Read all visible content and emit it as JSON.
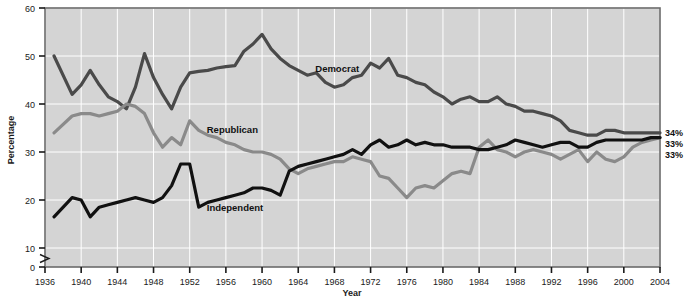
{
  "chart_data": {
    "type": "line",
    "title": "",
    "xlabel": "Year",
    "ylabel": "Percentage",
    "xlim": [
      1936,
      2004
    ],
    "ylim": [
      0,
      60
    ],
    "y_axis_break": true,
    "y_break_between": [
      0,
      10
    ],
    "grid": true,
    "grid_color": "#ffffff",
    "plot_background": "#d4d4d4",
    "legend_position": "inline-labels",
    "xticks": [
      1936,
      1940,
      1944,
      1948,
      1952,
      1956,
      1960,
      1964,
      1968,
      1972,
      1976,
      1980,
      1984,
      1988,
      1992,
      1996,
      2000,
      2004
    ],
    "ytick_labels": [
      "0",
      "10",
      "20",
      "30",
      "40",
      "50",
      "60"
    ],
    "yticks": [
      0,
      10,
      20,
      30,
      40,
      50,
      60
    ],
    "x": [
      1937,
      1939,
      1940,
      1941,
      1942,
      1943,
      1944,
      1945,
      1946,
      1947,
      1948,
      1949,
      1950,
      1951,
      1952,
      1953,
      1954,
      1955,
      1956,
      1957,
      1958,
      1959,
      1960,
      1961,
      1962,
      1963,
      1964,
      1965,
      1966,
      1967,
      1968,
      1969,
      1970,
      1971,
      1972,
      1973,
      1974,
      1975,
      1976,
      1977,
      1978,
      1979,
      1980,
      1981,
      1982,
      1983,
      1984,
      1985,
      1986,
      1987,
      1988,
      1989,
      1990,
      1991,
      1992,
      1993,
      1994,
      1995,
      1996,
      1997,
      1998,
      1999,
      2000,
      2001,
      2002,
      2003,
      2004
    ],
    "series": [
      {
        "name": "Democrat",
        "color": "#4a4a4a",
        "label_anchor_year": 1965,
        "end_value_label": "34%",
        "values": [
          50.0,
          42.0,
          44.0,
          47.0,
          44.0,
          41.5,
          40.5,
          39.0,
          43.5,
          50.5,
          45.5,
          42.0,
          39.0,
          43.5,
          46.5,
          46.8,
          47.0,
          47.5,
          47.8,
          48.0,
          51.0,
          52.5,
          54.5,
          51.5,
          49.5,
          48.0,
          47.0,
          46.0,
          46.5,
          44.5,
          43.5,
          44.0,
          45.5,
          46.0,
          48.5,
          47.5,
          49.5,
          46.0,
          45.5,
          44.5,
          44.0,
          42.5,
          41.5,
          40.0,
          41.0,
          41.5,
          40.5,
          40.5,
          41.5,
          40.0,
          39.5,
          38.5,
          38.5,
          38.0,
          37.5,
          36.5,
          34.5,
          34.0,
          33.5,
          33.5,
          34.5,
          34.5,
          34.0,
          34.0,
          34.0,
          34.0,
          34.0
        ]
      },
      {
        "name": "Republican",
        "color": "#8a8a8a",
        "label_anchor_year": 1953,
        "end_value_label": "33%",
        "values": [
          34.0,
          37.5,
          38.0,
          38.0,
          37.5,
          38.0,
          38.5,
          40.0,
          39.5,
          38.0,
          34.0,
          31.0,
          33.0,
          31.5,
          36.5,
          34.5,
          33.5,
          33.0,
          32.0,
          31.5,
          30.5,
          30.0,
          30.0,
          29.5,
          28.5,
          26.5,
          25.5,
          26.5,
          27.0,
          27.5,
          28.0,
          28.0,
          29.0,
          28.5,
          28.0,
          25.0,
          24.5,
          22.5,
          20.5,
          22.5,
          23.0,
          22.5,
          24.0,
          25.5,
          26.0,
          25.5,
          31.0,
          32.5,
          30.5,
          30.0,
          29.0,
          30.0,
          30.5,
          30.0,
          29.5,
          28.5,
          29.5,
          30.5,
          28.0,
          30.0,
          28.5,
          28.0,
          29.0,
          31.0,
          32.0,
          32.5,
          33.0
        ]
      },
      {
        "name": "Independent",
        "color": "#111111",
        "label_anchor_year": 1953,
        "end_value_label": "33%",
        "values": [
          16.5,
          20.5,
          20.0,
          16.5,
          18.5,
          19.0,
          19.5,
          20.0,
          20.5,
          20.0,
          19.5,
          20.5,
          23.0,
          27.5,
          27.5,
          18.5,
          19.5,
          20.0,
          20.5,
          21.0,
          21.5,
          22.5,
          22.5,
          22.0,
          21.0,
          26.0,
          27.0,
          27.5,
          28.0,
          28.5,
          29.0,
          29.5,
          30.5,
          29.5,
          31.5,
          32.5,
          31.0,
          31.5,
          32.5,
          31.5,
          32.0,
          31.5,
          31.5,
          31.0,
          31.0,
          31.0,
          30.5,
          30.5,
          31.0,
          31.5,
          32.5,
          32.0,
          31.5,
          31.0,
          31.5,
          32.0,
          32.0,
          31.0,
          31.0,
          32.0,
          32.5,
          32.5,
          32.5,
          32.5,
          32.5,
          33.0,
          33.0
        ]
      }
    ]
  }
}
